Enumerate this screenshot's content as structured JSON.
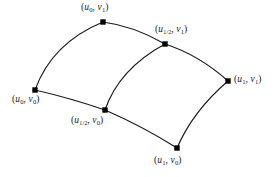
{
  "figure": {
    "background_color": "#ffffff",
    "stroke_color": "#1a1a1a",
    "node_fill_color": "#000000",
    "nodes": [
      {
        "id": "u0-v1",
        "x": 103,
        "y": 22,
        "label_prefix": "(",
        "u_var": "u",
        "u_sub": "0",
        "separator": ", ",
        "v_var": "v",
        "v_sub": "1",
        "label_suffix": ")",
        "label_text": "(u0, v1)",
        "label_x": 81,
        "label_y": 3
      },
      {
        "id": "uhalf-v1",
        "x": 165,
        "y": 44,
        "label_prefix": "(",
        "u_var": "u",
        "u_sub": "1/2",
        "separator": ", ",
        "v_var": "v",
        "v_sub": "1",
        "label_suffix": ")",
        "label_text": "(u1/2, v1)",
        "label_x": 155,
        "label_y": 25
      },
      {
        "id": "u1-v1",
        "x": 228,
        "y": 81,
        "label_prefix": "(",
        "u_var": "u",
        "u_sub": "1",
        "separator": ", ",
        "v_var": "v",
        "v_sub": "1",
        "label_suffix": ")",
        "label_text": "(u1, v1)",
        "label_x": 234,
        "label_y": 75
      },
      {
        "id": "u0-v0",
        "x": 35,
        "y": 90,
        "label_prefix": "(",
        "u_var": "u",
        "u_sub": "0",
        "separator": ", ",
        "v_var": "v",
        "v_sub": "0",
        "label_suffix": ")",
        "label_text": "(u0, v0)",
        "label_x": 12,
        "label_y": 95
      },
      {
        "id": "uhalf-v0",
        "x": 105,
        "y": 110,
        "label_prefix": "(",
        "u_var": "u",
        "u_sub": "1/2",
        "separator": ", ",
        "v_var": "v",
        "v_sub": "0",
        "label_suffix": ")",
        "label_text": "(u1/2, v0)",
        "label_x": 71,
        "label_y": 116
      },
      {
        "id": "u1-v0",
        "x": 177,
        "y": 148,
        "label_prefix": "(",
        "u_var": "u",
        "u_sub": "1",
        "separator": ", ",
        "v_var": "v",
        "v_sub": "0",
        "label_suffix": ")",
        "label_text": "(u1, v0)",
        "label_x": 154,
        "label_y": 156
      }
    ],
    "curves": [
      {
        "id": "top-left-arc",
        "from": "u0-v1",
        "to": "uhalf-v1",
        "path": "M 103 22 Q 134 26 165 44"
      },
      {
        "id": "top-right-arc",
        "from": "uhalf-v1",
        "to": "u1-v1",
        "path": "M 165 44 Q 199 55 228 81"
      },
      {
        "id": "left-boundary-arc",
        "from": "u0-v0",
        "to": "u0-v1",
        "path": "M 35 90 Q 52 43 103 22"
      },
      {
        "id": "middle-vertical-arc",
        "from": "uhalf-v0",
        "to": "uhalf-v1",
        "path": "M 105 110 Q 119 69 165 44"
      },
      {
        "id": "right-boundary-arc",
        "from": "u1-v0",
        "to": "u1-v1",
        "path": "M 177 148 Q 193 111 228 81"
      },
      {
        "id": "bottom-left-arc",
        "from": "u0-v0",
        "to": "uhalf-v0",
        "path": "M 35 90 Q 70 98 105 110"
      },
      {
        "id": "bottom-right-arc",
        "from": "uhalf-v0",
        "to": "u1-v0",
        "path": "M 105 110 Q 142 126 177 148"
      }
    ]
  }
}
